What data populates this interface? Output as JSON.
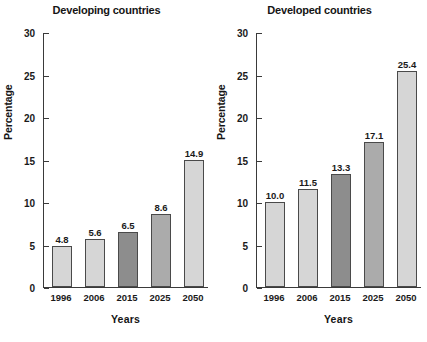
{
  "chart_data": [
    {
      "type": "bar",
      "title": "Developing countries",
      "xlabel": "Years",
      "ylabel": "Percentage",
      "categories": [
        "1996",
        "2006",
        "2015",
        "2025",
        "2050"
      ],
      "values": [
        4.8,
        5.6,
        6.5,
        8.6,
        14.9
      ],
      "value_labels": [
        "4.8",
        "5.6",
        "6.5",
        "8.6",
        "14.9"
      ],
      "bar_colors": [
        "#d6d6d6",
        "#d6d6d6",
        "#8d8d8d",
        "#ababab",
        "#d6d6d6"
      ],
      "ylim": [
        0,
        30
      ],
      "yticks": [
        0,
        5,
        10,
        15,
        20,
        25,
        30
      ],
      "ytick_labels": [
        "0",
        "5",
        "10",
        "15",
        "20",
        "25",
        "30"
      ],
      "grid": false,
      "legend": "none"
    },
    {
      "type": "bar",
      "title": "Developed countries",
      "xlabel": "Years",
      "ylabel": "Percentage",
      "categories": [
        "1996",
        "2006",
        "2015",
        "2025",
        "2050"
      ],
      "values": [
        10.0,
        11.5,
        13.3,
        17.1,
        25.4
      ],
      "value_labels": [
        "10.0",
        "11.5",
        "13.3",
        "17.1",
        "25.4"
      ],
      "bar_colors": [
        "#d6d6d6",
        "#d6d6d6",
        "#8d8d8d",
        "#ababab",
        "#d6d6d6"
      ],
      "ylim": [
        0,
        30
      ],
      "yticks": [
        0,
        5,
        10,
        15,
        20,
        25,
        30
      ],
      "ytick_labels": [
        "0",
        "5",
        "10",
        "15",
        "20",
        "25",
        "30"
      ],
      "grid": false,
      "legend": "none"
    }
  ]
}
